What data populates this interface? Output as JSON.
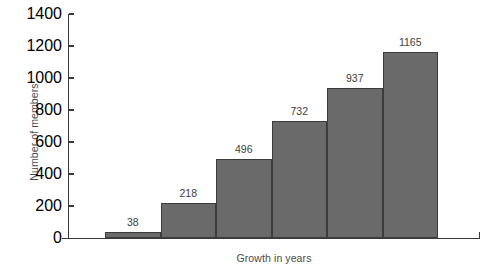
{
  "chart_data": {
    "type": "bar",
    "title": "",
    "xlabel": "Growth in years",
    "ylabel": "Number of members",
    "categories": [
      "",
      "",
      "",
      "",
      "",
      ""
    ],
    "values": [
      38,
      218,
      496,
      732,
      937,
      1165
    ],
    "data_labels": [
      "38",
      "218",
      "496",
      "732",
      "937",
      "1165"
    ],
    "ylim": [
      0,
      1400
    ],
    "yticks": [
      0,
      200,
      400,
      600,
      800,
      1000,
      1200,
      1400
    ],
    "ytick_labels": [
      "0",
      "200",
      "400",
      "600",
      "800",
      "1000",
      "1200",
      "1400"
    ],
    "xtick_labels": [],
    "grid": false,
    "legend": null,
    "bar_color": "#6a6a6a",
    "bar_edge_color": "#3c3c3c",
    "axis_color": "#3a3a3a",
    "text_color": "#3d3d3d",
    "background": "#ffffff"
  }
}
